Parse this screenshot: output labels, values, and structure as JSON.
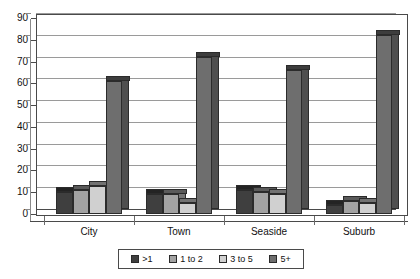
{
  "chart_data": {
    "type": "bar",
    "title": "",
    "subtitle": "",
    "xlabel": "",
    "ylabel": "",
    "ylim": [
      0,
      90
    ],
    "ytick_step": 10,
    "yticks": [
      90,
      80,
      70,
      60,
      50,
      40,
      30,
      20,
      10,
      0
    ],
    "grid": true,
    "legend_position": "bottom",
    "style": "3d-grayscale-column",
    "categories": [
      "City",
      "Town",
      "Seaside",
      "Suburb"
    ],
    "series": [
      {
        "name": ">1",
        "color": "#3f3f3f",
        "values": [
          10,
          9,
          11,
          4
        ]
      },
      {
        "name": "1 to 2",
        "color": "#a3a3a3",
        "values": [
          11,
          9,
          10,
          6
        ]
      },
      {
        "name": "3 to 5",
        "color": "#d0d0d0",
        "values": [
          13,
          5,
          9,
          5
        ]
      },
      {
        "name": "5+",
        "color": "#6e6e6e",
        "values": [
          61,
          72,
          66,
          82
        ]
      }
    ]
  },
  "axis": {
    "y_tick_labels": [
      "90",
      "80",
      "70",
      "60",
      "50",
      "40",
      "30",
      "20",
      "10",
      "0"
    ],
    "x_category_labels": [
      "City",
      "Town",
      "Seaside",
      "Suburb"
    ]
  },
  "legend": {
    "items": [
      {
        "label": ">1",
        "color": "#3f3f3f"
      },
      {
        "label": "1 to 2",
        "color": "#a3a3a3"
      },
      {
        "label": "3 to 5",
        "color": "#d0d0d0"
      },
      {
        "label": "5+",
        "color": "#6e6e6e"
      }
    ]
  },
  "colors": {
    "plot_background": "#ffffff",
    "gridline": "#9a9a9a",
    "axis": "#4a4a4a",
    "text": "#111111"
  }
}
